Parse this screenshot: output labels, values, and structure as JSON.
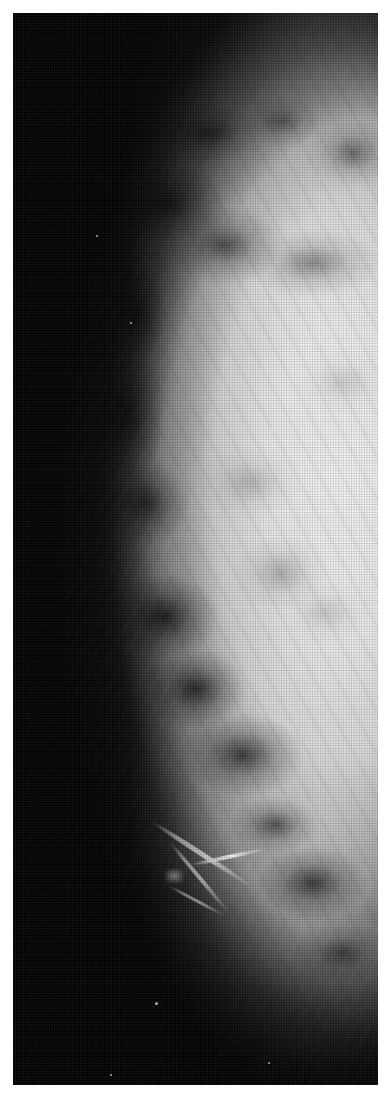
{
  "document": {
    "kind": "medical-radiograph",
    "modality": "mammogram",
    "caption": ""
  },
  "canvas": {
    "width_px": 390,
    "height_px": 1104,
    "background_color": "#ffffff"
  },
  "radiograph": {
    "name": "mammogram-image",
    "frame": {
      "x": 13,
      "y": 13,
      "width": 365,
      "height": 1072
    },
    "background_color": "#000000",
    "tissue_highlight_color": "#ffffff",
    "midtone_color": "#9a9a9a",
    "shadow_color": "#141414",
    "orientation_note": "breast profile with convex skin line running down the left side, dense parenchyma filling the right portion",
    "print_texture": "halftone-dot-screen",
    "features": [
      {
        "name": "skin-line-contour",
        "description": "convex anterior breast border curving from upper right to lower right"
      },
      {
        "name": "dense-parenchyma",
        "description": "large bright fibroglandular mass occupying the central and right field"
      },
      {
        "name": "fat-lobules",
        "description": "darker rounded lucencies along the subcutaneous band"
      },
      {
        "name": "vascular-streaks",
        "description": "bright branching linear densities near the inferior margin"
      },
      {
        "name": "background-film",
        "description": "black unexposed film outside the breast"
      }
    ],
    "specks": [
      {
        "x": 155,
        "y": 1002,
        "size": 3
      },
      {
        "x": 110,
        "y": 1074,
        "size": 2
      },
      {
        "x": 268,
        "y": 1062,
        "size": 2
      },
      {
        "x": 96,
        "y": 235,
        "size": 2
      },
      {
        "x": 130,
        "y": 322,
        "size": 2
      }
    ]
  }
}
